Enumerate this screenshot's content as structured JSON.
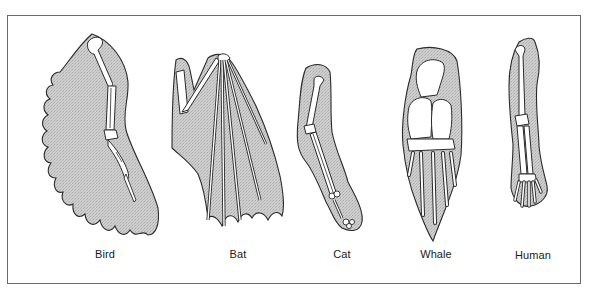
{
  "diagram": {
    "title": "",
    "figure_type": "homologous forelimb comparison",
    "colors": {
      "skin_fill": "#c9c9c9",
      "outline": "#2a2a2a",
      "bone_fill": "#ffffff",
      "frame_border": "#6a6a6a",
      "background": "#ffffff"
    },
    "limbs": [
      {
        "id": "bird",
        "label": "Bird",
        "icon": "bird-wing-icon"
      },
      {
        "id": "bat",
        "label": "Bat",
        "icon": "bat-wing-icon"
      },
      {
        "id": "cat",
        "label": "Cat",
        "icon": "cat-foreleg-icon"
      },
      {
        "id": "whale",
        "label": "Whale",
        "icon": "whale-flipper-icon"
      },
      {
        "id": "human",
        "label": "Human",
        "icon": "human-arm-icon"
      }
    ]
  }
}
